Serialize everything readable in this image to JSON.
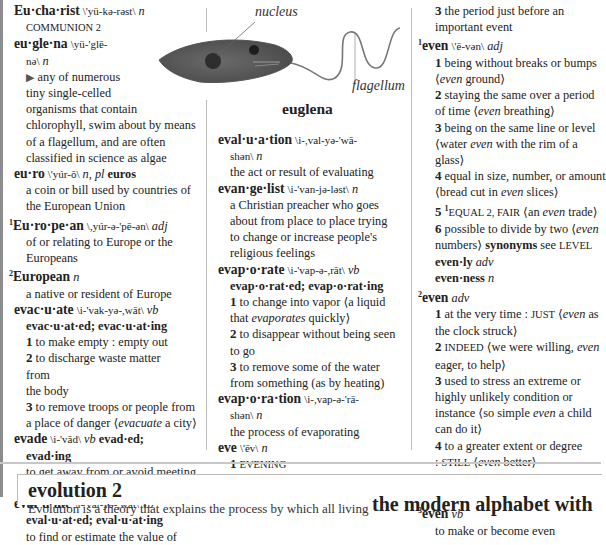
{
  "col1": {
    "eucharist": {
      "hw": "Eu·cha·rist",
      "pron": "\\'yü-kə-rəst\\",
      "pos": "n",
      "def": "COMMUNION 2"
    },
    "euglena": {
      "hw": "eu·gle·na",
      "pron1": "\\yü-'glē-",
      "pron2": "nə\\",
      "pos": "n",
      "arrow": "▶",
      "lines": [
        "any of numerous",
        "tiny single-celled",
        "organisms that contain",
        "chlorophyll, swim about by means",
        "of a flagellum, and are often",
        "classified in science as algae"
      ]
    },
    "euro": {
      "hw": "eu·ro",
      "pron": "\\'yúr-ō\\",
      "pos": "n, pl",
      "plural": "euros",
      "lines": [
        "a coin or bill used by countries of",
        "the European Union"
      ]
    },
    "european1": {
      "hom": "1",
      "hw": "Eu·ro·pe·an",
      "pron": "\\,yúr-ə-'pē-ən\\",
      "pos": "adj",
      "lines": [
        "of or relating to Europe or the",
        "Europeans"
      ]
    },
    "european2": {
      "hom": "2",
      "hw": "European",
      "pos": "n",
      "lines": [
        "a native or resident of Europe"
      ]
    },
    "evacuate": {
      "hw": "evac·u·ate",
      "pron": "\\i-'vak-yə-,wāt\\",
      "pos": "vb",
      "forms": "evac·u·at·ed; evac·u·at·ing",
      "senses": [
        {
          "n": "1",
          "lines": [
            "to make empty : empty out"
          ]
        },
        {
          "n": "2",
          "lines": [
            "to discharge waste matter from",
            "the body"
          ]
        },
        {
          "n": "3",
          "lines": [
            "to remove troops or people from"
          ],
          "pre": "a place of danger ⟨",
          "it": "evacuate",
          "post": " a city⟩"
        }
      ]
    },
    "evade": {
      "hw": "evade",
      "pron": "\\i-'vād\\",
      "pos": "vb",
      "form1": "evad·ed;",
      "form2": "evad·ing",
      "line1": "to get away from or avoid meeting",
      "pre": "directly ⟨",
      "it": "evade",
      "post": " a question⟩"
    },
    "evaluate": {
      "hw": "eval·u·ate",
      "pron": "\\i-'val-yə-,wāt\\",
      "pos": "vb",
      "forms": "eval·u·at·ed; eval·u·at·ing",
      "line1": "to find or estimate the value of"
    }
  },
  "figure": {
    "label_nucleus": "nucleus",
    "label_flagellum": "flagellum",
    "caption": "euglena"
  },
  "col2": {
    "evaluation": {
      "hw": "eval·u·a·tion",
      "pron1": "\\i-,val-yə-'wā-",
      "pron2": "shən\\",
      "pos": "n",
      "def": "the act or result of evaluating"
    },
    "evangelist": {
      "hw": "evan·ge·list",
      "pron": "\\i-'van-jə-ləst\\",
      "pos": "n",
      "lines": [
        "a Christian preacher who goes",
        "about from place to place trying",
        "to change or increase people's",
        "religious feelings"
      ]
    },
    "evaporate": {
      "hw": "evap·o·rate",
      "pron": "\\i-'vap-ə-,rāt\\",
      "pos": "vb",
      "forms": "evap·o·rat·ed; evap·o·rat·ing",
      "senses": [
        {
          "n": "1",
          "line": "to change into vapor ⟨a liquid",
          "pre": "that ",
          "it": "evaporates",
          "post": " quickly⟩"
        },
        {
          "n": "2",
          "line": "to disappear without being seen",
          "line2": "to go"
        },
        {
          "n": "3",
          "line": "to remove some of the water",
          "line2": "from something (as by heating)"
        }
      ]
    },
    "evaporation": {
      "hw": "evap·o·ra·tion",
      "pron1": "\\i-,vap-ə-'rā-",
      "pron2": "shən\\",
      "pos": "n",
      "def": "the process of evaporating"
    },
    "eve": {
      "hw": "eve",
      "pron": "\\'ēv\\",
      "pos": "n",
      "s1": {
        "n": "1",
        "sc": "EVENING"
      },
      "s2": {
        "n": "2",
        "line": "the evening or day before a",
        "pre": "special day ⟨Christmas ",
        "it": "eve",
        "post": "⟩"
      }
    }
  },
  "col3": {
    "eve_s3": {
      "n": "3",
      "lines": [
        "the period just before an",
        "important event"
      ]
    },
    "even1": {
      "hom": "1",
      "hw": "even",
      "pron": "\\'ē-vən\\",
      "pos": "adj",
      "senses": [
        {
          "n": "1",
          "line": "being without breaks or bumps",
          "pre": "⟨",
          "it": "even",
          "post": " ground⟩"
        },
        {
          "n": "2",
          "line": "staying the same over a period",
          "pre": "of time ⟨",
          "it": "even",
          "post": " breathing⟩"
        },
        {
          "n": "3",
          "line": "being on the same line or level",
          "pre": "⟨water ",
          "it": "even",
          "post": " with the rim of a",
          "line3": "glass⟩"
        },
        {
          "n": "4",
          "line": "equal in size, number, or amount",
          "pre": "⟨bread cut in ",
          "it": "even",
          "post": " slices⟩"
        },
        {
          "n": "5",
          "hom": "1",
          "sc": "EQUAL 2, FAIR",
          "pre": " ⟨an ",
          "it": "even",
          "post": " trade⟩"
        },
        {
          "n": "6",
          "line": "possible to divide by two ⟨",
          "it": "even",
          "line_b": "numbers⟩",
          "syn": "synonyms",
          "see": "see",
          "ref": "LEVEL"
        }
      ]
    },
    "evenly": {
      "hw": "even·ly",
      "pos": "adv"
    },
    "evenness": {
      "hw": "even·ness",
      "pos": "n"
    },
    "even2": {
      "hom": "2",
      "hw": "even",
      "pos": "adv",
      "senses": [
        {
          "n": "1",
          "pre": "at the very time : ",
          "sc": "JUST",
          "mid": " ⟨",
          "it": "even",
          "post": " as",
          "line2": "the clock struck⟩"
        },
        {
          "n": "2",
          "sc": "INDEED",
          "pre": " ⟨we were willing, ",
          "it": "even",
          "line2": "eager, to help⟩"
        },
        {
          "n": "3",
          "lines": [
            "used to stress an extreme or",
            "highly unlikely condition or"
          ],
          "pre": "instance ⟨so simple ",
          "it": "even",
          "post": " a child",
          "line_end": "can do it⟩"
        },
        {
          "n": "4",
          "line": "to a greater extent or degree",
          "pre": ": ",
          "sc": "STILL",
          "mid": " ⟨",
          "it": "even",
          "post": " better⟩"
        },
        {
          "n": "5",
          "pre": "so much as ⟨didn't ",
          "it": "even",
          "post": " offer to",
          "line2": "help⟩"
        }
      ]
    },
    "even3": {
      "hom": "3",
      "hw": "even",
      "pos": "vb",
      "def": "to make or become even"
    }
  },
  "panel": {
    "title": "evolution 2",
    "text": "Evolution is a theory that explains the process by which all living",
    "heading2": "the modern alphabet with"
  }
}
